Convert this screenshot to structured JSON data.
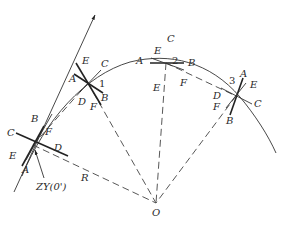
{
  "diagram": {
    "type": "circular-curve-setting-out",
    "center_label": "O",
    "radius_label": "R",
    "start_point_label": "ZY(0')",
    "stations": [
      {
        "id": "0",
        "labels": {
          "A": "A",
          "B": "B",
          "C": "C",
          "D": "D",
          "E": "E",
          "F": "F"
        }
      },
      {
        "id": "1",
        "number": "1",
        "labels": {
          "A": "A",
          "B": "B",
          "C": "C",
          "D": "D",
          "E": "E",
          "F": "F"
        }
      },
      {
        "id": "2",
        "number": "2",
        "labels": {
          "A": "A",
          "B": "B",
          "C": "C",
          "E": "E",
          "E2": "E",
          "F": "F"
        }
      },
      {
        "id": "3",
        "number": "3",
        "labels": {
          "A": "A",
          "B": "B",
          "C": "C",
          "D": "D",
          "E": "E",
          "F": "F"
        }
      }
    ],
    "colors": {
      "line": "#333333",
      "background": "#ffffff"
    }
  }
}
